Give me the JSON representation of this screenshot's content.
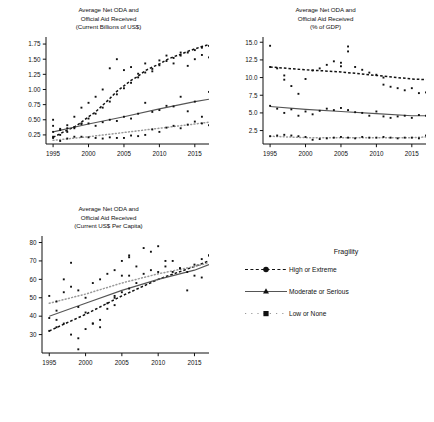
{
  "figure": {
    "background": "#ffffff",
    "text_color": "#111111"
  },
  "panels": {
    "top_left": {
      "title": "Average Net ODA and\nOfficial Aid Received\n(Current Billions of US$)"
    },
    "top_right": {
      "title": "Average Net ODA and\nOfficial Aid Received\n(% of GDP)"
    },
    "bottom_left": {
      "title": "Average Net ODA and\nOfficial Aid Received\n(Current US$ Per Capita)"
    }
  },
  "legend": {
    "title": "Fragility",
    "items": [
      {
        "label": "High or Extreme",
        "marker": "circle",
        "line": "dashed",
        "color": "#111111"
      },
      {
        "label": "Moderate or Serious",
        "marker": "triangle",
        "line": "solid",
        "color": "#555555"
      },
      {
        "label": "Low or None",
        "marker": "square",
        "line": "dotted",
        "color": "#999999"
      }
    ]
  },
  "chart_data": [
    {
      "id": "net-oda-billions",
      "type": "scatter",
      "title": "Average Net ODA and Official Aid Received (Current Billions of US$)",
      "xlabel": "",
      "ylabel": "Current Billions of US$",
      "xlim": [
        1994,
        2017
      ],
      "ylim": [
        0.1,
        1.85
      ],
      "xticks": [
        1995,
        2000,
        2005,
        2010,
        2015
      ],
      "yticks": [
        0.25,
        0.5,
        0.75,
        1.0,
        1.25,
        1.5,
        1.75
      ],
      "ytick_labels": [
        "0.25",
        "0.50",
        "0.75",
        "1.00",
        "1.25",
        "1.50",
        "1.75"
      ],
      "grid": false,
      "legend_position": "external",
      "series": [
        {
          "name": "High or Extreme",
          "marker": "circle",
          "line": "dashed",
          "color": "#111111",
          "x": [
            1995,
            1996,
            1997,
            1998,
            1999,
            2000,
            2001,
            2002,
            2003,
            2004,
            2005,
            2006,
            2007,
            2008,
            2009,
            2010,
            2011,
            2012,
            2013,
            2014,
            2015,
            2016,
            2017
          ],
          "y": [
            0.21,
            0.27,
            0.33,
            0.38,
            0.46,
            0.55,
            0.63,
            0.74,
            0.85,
            0.97,
            1.06,
            1.15,
            1.22,
            1.31,
            1.37,
            1.42,
            1.49,
            1.54,
            1.58,
            1.63,
            1.67,
            1.71,
            1.74
          ],
          "scatter_x": [
            1995,
            1995,
            1996,
            1996,
            1997,
            1997,
            1998,
            1998,
            1999,
            1999,
            2000,
            2000,
            2001,
            2001,
            2002,
            2002,
            2003,
            2003,
            2004,
            2004,
            2005,
            2005,
            2006,
            2006,
            2007,
            2007,
            2008,
            2008,
            2009,
            2009,
            2010,
            2010,
            2011,
            2011,
            2012,
            2012,
            2013,
            2013,
            2014,
            2014,
            2015,
            2015,
            2016,
            2016,
            2017,
            2017
          ],
          "scatter_y": [
            0.22,
            0.3,
            0.25,
            0.35,
            0.3,
            0.41,
            0.36,
            0.55,
            0.44,
            0.7,
            0.52,
            0.78,
            0.6,
            0.88,
            0.7,
            1.0,
            0.8,
            1.35,
            0.92,
            1.5,
            1.02,
            1.32,
            1.11,
            1.37,
            1.2,
            1.26,
            1.28,
            1.43,
            1.34,
            1.3,
            1.4,
            1.48,
            1.47,
            1.56,
            1.52,
            1.43,
            1.56,
            1.61,
            1.61,
            1.39,
            1.65,
            1.5,
            1.69,
            1.57,
            1.72,
            1.53
          ]
        },
        {
          "name": "Moderate or Serious",
          "marker": "triangle",
          "line": "solid",
          "color": "#555555",
          "x": [
            1995,
            2000,
            2005,
            2010,
            2015,
            2017
          ],
          "y": [
            0.3,
            0.43,
            0.55,
            0.68,
            0.8,
            0.84
          ],
          "scatter_x": [
            1995,
            1995,
            1996,
            1997,
            1998,
            1999,
            2000,
            2001,
            2002,
            2003,
            2004,
            2005,
            2006,
            2007,
            2008,
            2009,
            2010,
            2011,
            2012,
            2013,
            2014,
            2015,
            2016,
            2017
          ],
          "scatter_y": [
            0.5,
            0.4,
            0.33,
            0.36,
            0.38,
            0.43,
            0.44,
            0.4,
            0.46,
            0.5,
            0.48,
            0.55,
            0.52,
            0.6,
            0.78,
            0.63,
            0.66,
            0.73,
            0.72,
            0.88,
            0.64,
            0.8,
            0.55,
            0.96
          ]
        },
        {
          "name": "Low or None",
          "marker": "square",
          "line": "dotted",
          "color": "#999999",
          "x": [
            1995,
            2000,
            2005,
            2010,
            2015,
            2017
          ],
          "y": [
            0.16,
            0.22,
            0.29,
            0.36,
            0.43,
            0.46
          ],
          "scatter_x": [
            1995,
            1996,
            1997,
            1998,
            1999,
            2000,
            2001,
            2002,
            2003,
            2004,
            2005,
            2006,
            2007,
            2008,
            2009,
            2010,
            2011,
            2012,
            2013,
            2014,
            2015,
            2016,
            2017
          ],
          "scatter_y": [
            0.2,
            0.15,
            0.19,
            0.22,
            0.22,
            0.21,
            0.2,
            0.19,
            0.21,
            0.2,
            0.2,
            0.24,
            0.23,
            0.25,
            0.34,
            0.3,
            0.37,
            0.4,
            0.36,
            0.42,
            0.47,
            0.44,
            0.41
          ]
        }
      ]
    },
    {
      "id": "net-oda-pct-gdp",
      "type": "scatter",
      "title": "Average Net ODA and Official Aid Received (% of GDP)",
      "xlabel": "",
      "ylabel": "% of GDP",
      "xlim": [
        1994,
        2017
      ],
      "ylim": [
        0.6,
        15.6
      ],
      "xticks": [
        1995,
        2000,
        2005,
        2010,
        2015
      ],
      "yticks": [
        2.5,
        5.0,
        7.5,
        10.0,
        12.5,
        15.0
      ],
      "ytick_labels": [
        "2.5",
        "5.0",
        "7.5",
        "10.0",
        "12.5",
        "15.0"
      ],
      "grid": false,
      "legend_position": "external",
      "series": [
        {
          "name": "High or Extreme",
          "marker": "circle",
          "line": "dashed",
          "color": "#111111",
          "x": [
            1995,
            2000,
            2005,
            2010,
            2015,
            2017
          ],
          "y": [
            11.5,
            11.1,
            10.8,
            10.3,
            9.8,
            9.7
          ],
          "scatter_x": [
            1995,
            1995,
            1996,
            1997,
            1997,
            1998,
            1999,
            2000,
            2001,
            2002,
            2003,
            2004,
            2005,
            2005,
            2006,
            2006,
            2007,
            2008,
            2009,
            2010,
            2011,
            2011,
            2012,
            2013,
            2014,
            2015,
            2016,
            2017
          ],
          "scatter_y": [
            11.5,
            14.5,
            11.3,
            10.3,
            9.7,
            8.8,
            7.7,
            9.8,
            11.0,
            11.3,
            11.8,
            12.3,
            11.6,
            12.1,
            14.4,
            13.7,
            11.5,
            11.1,
            10.7,
            10.4,
            10.0,
            9.0,
            8.7,
            8.5,
            8.2,
            8.5,
            7.8,
            7.9
          ]
        },
        {
          "name": "Moderate or Serious",
          "marker": "triangle",
          "line": "solid",
          "color": "#555555",
          "x": [
            1995,
            2000,
            2005,
            2010,
            2015,
            2017
          ],
          "y": [
            5.9,
            5.5,
            5.2,
            4.9,
            4.6,
            4.6
          ],
          "scatter_x": [
            1995,
            1996,
            1997,
            1998,
            1999,
            2000,
            2001,
            2002,
            2003,
            2004,
            2005,
            2006,
            2007,
            2008,
            2009,
            2010,
            2011,
            2012,
            2013,
            2014,
            2015,
            2016,
            2017
          ],
          "scatter_y": [
            6.0,
            5.6,
            5.0,
            5.5,
            4.6,
            5.2,
            4.8,
            5.3,
            5.6,
            5.4,
            5.7,
            5.4,
            5.1,
            5.0,
            4.6,
            5.2,
            4.5,
            4.3,
            4.5,
            4.6,
            4.3,
            4.7,
            4.6
          ]
        },
        {
          "name": "Low or None",
          "marker": "square",
          "line": "dotted",
          "color": "#999999",
          "x": [
            1995,
            2000,
            2005,
            2010,
            2015,
            2017
          ],
          "y": [
            1.7,
            1.5,
            1.5,
            1.5,
            1.5,
            1.6
          ],
          "scatter_x": [
            1995,
            1996,
            1997,
            1998,
            1999,
            2000,
            2001,
            2002,
            2003,
            2004,
            2005,
            2006,
            2007,
            2008,
            2009,
            2010,
            2011,
            2012,
            2013,
            2014,
            2015,
            2016,
            2017
          ],
          "scatter_y": [
            1.7,
            1.8,
            1.9,
            1.8,
            1.7,
            1.6,
            1.2,
            1.3,
            1.4,
            1.5,
            1.6,
            1.5,
            1.4,
            1.6,
            1.5,
            1.5,
            1.6,
            1.5,
            1.4,
            1.5,
            1.5,
            1.4,
            1.8
          ]
        }
      ]
    },
    {
      "id": "net-oda-per-capita",
      "type": "scatter",
      "title": "Average Net ODA and Official Aid Received (Current US$ Per Capita)",
      "xlabel": "",
      "ylabel": "Current US$ Per Capita",
      "xlim": [
        1994,
        2017
      ],
      "ylim": [
        20,
        83
      ],
      "xticks": [
        1995,
        2000,
        2005,
        2010,
        2015
      ],
      "yticks": [
        30,
        40,
        50,
        60,
        70,
        80
      ],
      "ytick_labels": [
        "30",
        "40",
        "50",
        "60",
        "70",
        "80"
      ],
      "grid": false,
      "legend_position": "external",
      "series": [
        {
          "name": "High or Extreme",
          "marker": "circle",
          "line": "dashed",
          "color": "#111111",
          "x": [
            1995,
            2000,
            2005,
            2010,
            2015,
            2017
          ],
          "y": [
            32,
            41,
            51,
            60,
            67,
            70
          ],
          "scatter_x": [
            1995,
            1996,
            1996,
            1997,
            1998,
            1999,
            1999,
            2000,
            2001,
            2002,
            2003,
            2004,
            2004,
            2005,
            2006,
            2006,
            2007,
            2008,
            2009,
            2010,
            2011,
            2012,
            2013,
            2014,
            2015,
            2016,
            2017
          ],
          "scatter_y": [
            32,
            34,
            38,
            36,
            30,
            22,
            28,
            33,
            36,
            38,
            44,
            46,
            51,
            53,
            55,
            62,
            58,
            63,
            65,
            64,
            67,
            70,
            66,
            64,
            68,
            71,
            73
          ]
        },
        {
          "name": "Moderate or Serious",
          "marker": "triangle",
          "line": "solid",
          "color": "#555555",
          "x": [
            1995,
            2000,
            2005,
            2010,
            2015,
            2017
          ],
          "y": [
            40,
            47,
            54,
            60,
            65,
            68
          ],
          "scatter_x": [
            1995,
            1996,
            1997,
            1998,
            1999,
            2000,
            2001,
            2002,
            2003,
            2004,
            2005,
            2006,
            2007,
            2008,
            2009,
            2010,
            2011,
            2012,
            2013,
            2014,
            2015,
            2016,
            2017
          ],
          "scatter_y": [
            39,
            43,
            60,
            69,
            45,
            42,
            36,
            34,
            47,
            50,
            62,
            72,
            67,
            77,
            75,
            78,
            70,
            64,
            66,
            54,
            62,
            61,
            73
          ]
        },
        {
          "name": "Low or None",
          "marker": "square",
          "line": "dotted",
          "color": "#999999",
          "x": [
            1995,
            2000,
            2005,
            2010,
            2015,
            2017
          ],
          "y": [
            47,
            52,
            58,
            63,
            67,
            69
          ],
          "scatter_x": [
            1995,
            1996,
            1997,
            1998,
            1999,
            2000,
            2001,
            2002,
            2003,
            2004,
            2005,
            2006
          ],
          "scatter_y": [
            51,
            48,
            53,
            56,
            54,
            50,
            58,
            60,
            63,
            65,
            70,
            73
          ]
        }
      ]
    }
  ]
}
